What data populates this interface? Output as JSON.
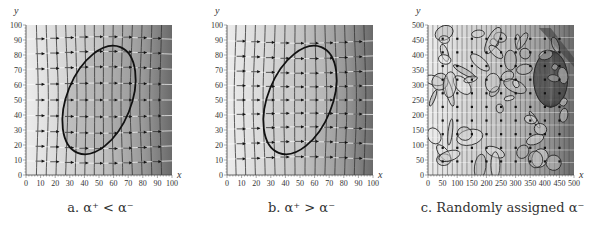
{
  "chart_data": [
    {
      "type": "vector-field",
      "panel": "a",
      "caption": "a. α⁺ < α⁻",
      "xlabel": "x",
      "ylabel": "y",
      "xlim": [
        0,
        100
      ],
      "ylim": [
        0,
        100
      ],
      "xticks": [
        0,
        10,
        20,
        30,
        40,
        50,
        60,
        70,
        80,
        90,
        100
      ],
      "yticks": [
        0,
        10,
        20,
        30,
        40,
        50,
        60,
        70,
        80,
        90,
        100
      ],
      "ellipse": {
        "cx": 50,
        "cy": 50,
        "rx": 22,
        "ry": 38,
        "rotation_deg": 22
      },
      "shading": "light on left, dark on right; darker inside ellipse",
      "grid": false
    },
    {
      "type": "vector-field",
      "panel": "b",
      "caption": "b. α⁺ > α⁻",
      "xlabel": "x",
      "ylabel": "y",
      "xlim": [
        0,
        100
      ],
      "ylim": [
        0,
        100
      ],
      "xticks": [
        0,
        10,
        20,
        30,
        40,
        50,
        60,
        70,
        80,
        90,
        100
      ],
      "yticks": [
        0,
        10,
        20,
        30,
        40,
        50,
        60,
        70,
        80,
        90,
        100
      ],
      "ellipse": {
        "cx": 50,
        "cy": 50,
        "rx": 22,
        "ry": 38,
        "rotation_deg": 22
      },
      "shading": "light on left, dark on right; lighter uniform inside ellipse",
      "grid": false
    },
    {
      "type": "vector-field",
      "panel": "c",
      "caption": "c. Randomly assigned α⁻",
      "xlabel": "x",
      "ylabel": "y",
      "xlim": [
        0,
        500
      ],
      "ylim": [
        0,
        500
      ],
      "xticks": [
        0,
        50,
        100,
        150,
        200,
        250,
        300,
        350,
        400,
        450,
        500
      ],
      "yticks": [
        0,
        50,
        100,
        150,
        200,
        250,
        300,
        350,
        400,
        450,
        500
      ],
      "shading": "many random elliptical inclusions, large dark inclusion near (420, 320)",
      "grid": false
    }
  ],
  "captions": {
    "a": "a. α⁺ < α⁻",
    "b": "b. α⁺ > α⁻",
    "c": "c. Randomly assigned α⁻"
  },
  "axes": {
    "x_label": "x",
    "y_label": "y",
    "ticks_100": [
      "0",
      "10",
      "20",
      "30",
      "40",
      "50",
      "60",
      "70",
      "80",
      "90",
      "100"
    ],
    "ticks_500": [
      "0",
      "50",
      "100",
      "150",
      "200",
      "250",
      "300",
      "350",
      "400",
      "450",
      "500"
    ]
  }
}
